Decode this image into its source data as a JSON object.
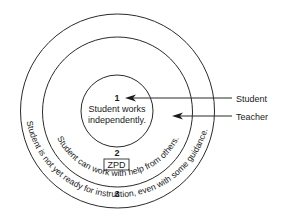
{
  "diagram": {
    "type": "concentric-circles",
    "zones": [
      {
        "number": "1",
        "text_line1": "Student works",
        "text_line2": "independently."
      },
      {
        "number": "2",
        "box_label": "ZPD",
        "curved_text": "Student can work with help from others."
      },
      {
        "number": "3",
        "curved_text": "Student is not yet ready for instruction, even with some guidance."
      }
    ],
    "pointers": [
      {
        "label": "Student"
      },
      {
        "label": "Teacher"
      }
    ],
    "colors": {
      "stroke": "#2a2a2a",
      "text": "#1a1a1a",
      "background": "#ffffff"
    }
  }
}
